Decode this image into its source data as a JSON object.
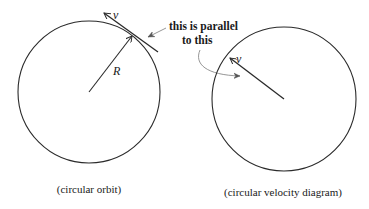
{
  "diagram": {
    "left": {
      "name": "circular-orbit",
      "circle": {
        "cx": 89,
        "cy": 92,
        "r": 71
      },
      "radius_vector": {
        "x1": 89,
        "y1": 92,
        "x2": 132,
        "y2": 36,
        "label": "R"
      },
      "velocity_vector": {
        "x1": 158,
        "y1": 52,
        "x2": 104,
        "y2": 13,
        "label": "v"
      },
      "caption": "(circular orbit)"
    },
    "right": {
      "name": "circular-velocity-diagram",
      "circle": {
        "cx": 284,
        "cy": 99,
        "r": 72
      },
      "velocity_vector": {
        "x1": 284,
        "y1": 99,
        "x2": 229,
        "y2": 57,
        "label": "v"
      },
      "caption": "(circular velocity diagram)"
    },
    "annotation": {
      "line1": "this is parallel",
      "line2": "to this"
    },
    "colors": {
      "stroke": "#2a2a2a",
      "text": "#1a1a1a",
      "pointer": "#8a8a8a",
      "background": "#ffffff"
    }
  }
}
